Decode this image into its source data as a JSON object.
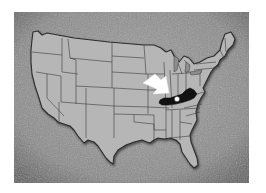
{
  "map": {
    "subject": "United States map with Kentucky highlighted",
    "highlighted_state": "Kentucky",
    "highlight_color": "#111111",
    "land_color": "#b4b4b4",
    "background_color": "#8f8f8f",
    "border_color": "#3a3a3a",
    "marker": "white-dot-on-kentucky",
    "pointer": "white-arrow-pointing-to-kentucky"
  }
}
